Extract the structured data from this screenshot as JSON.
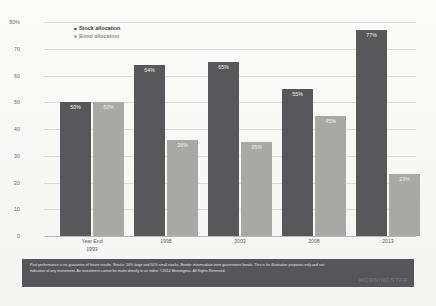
{
  "chart_data": {
    "type": "bar",
    "title": "",
    "xlabel": "Year End",
    "ylabel": "",
    "ylim": [
      0,
      80
    ],
    "grid": true,
    "legend_position": "top-left",
    "categories": [
      "1993",
      "1998",
      "2003",
      "2008",
      "2013"
    ],
    "yticks": [
      "80%",
      "70",
      "60",
      "50",
      "40",
      "30",
      "20",
      "10",
      "0"
    ],
    "ytick_values": [
      80,
      70,
      60,
      50,
      40,
      30,
      20,
      10,
      0
    ],
    "series": [
      {
        "name": "Stock allocation",
        "color": "#58585a",
        "values": [
          50,
          64,
          65,
          55,
          77
        ],
        "labels": [
          "50%",
          "64%",
          "65%",
          "55%",
          "77%"
        ]
      },
      {
        "name": "Bond allocation",
        "color": "#a8a8a4",
        "values": [
          50,
          36,
          35,
          45,
          23
        ],
        "labels": [
          "50%",
          "36%",
          "35%",
          "45%",
          "23%"
        ]
      }
    ]
  },
  "legend": {
    "stock_label": "Stock allocation",
    "bond_label": "Bond allocation"
  },
  "axis": {
    "year_end_caption": "Year End"
  },
  "footer": {
    "disclaimer": "Past performance is no guarantee of future results. Stocks: 50% large and 50% small stocks. Bonds: intermediate-term government bonds. This is for illustrative purposes only and not indicative of any investment. An investment cannot be made directly in an index. ©2014 Morningstar. All Rights Reserved.",
    "brand": "MORNINGSTAR"
  },
  "colors": {
    "stock": "#58585a",
    "bond": "#a8a8a4",
    "footer_band": "#55555a",
    "grid": "#ddddd8"
  }
}
